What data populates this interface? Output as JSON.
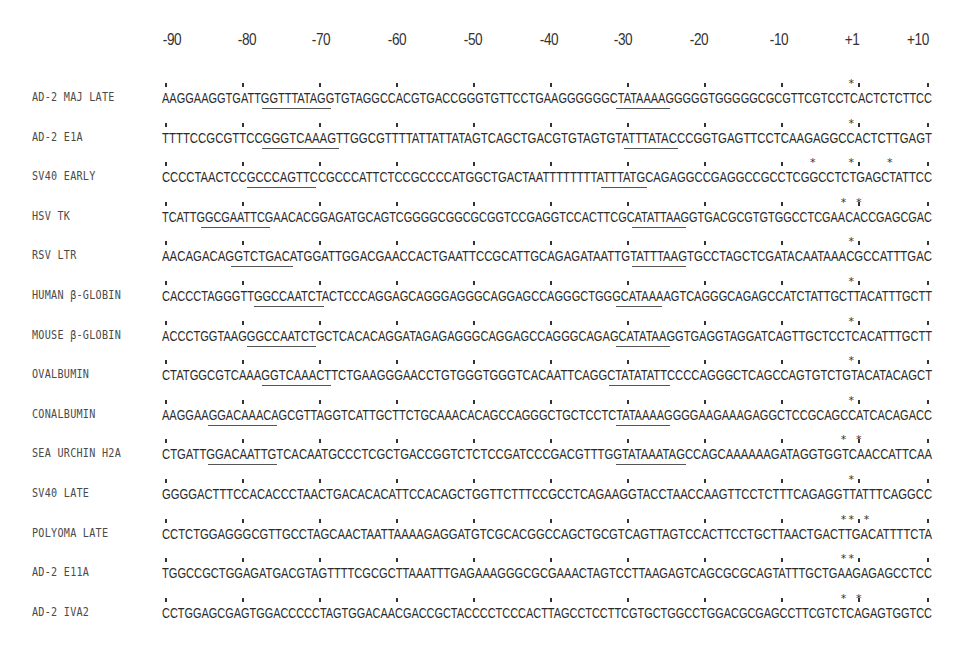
{
  "figure": {
    "axis_ticks": [
      "-90",
      "-80",
      "-70",
      "-60",
      "-50",
      "-40",
      "-30",
      "-20",
      "-10",
      "+1",
      "+10"
    ],
    "axis_tick_x": [
      172,
      247,
      321,
      397,
      473,
      549,
      623,
      699,
      779,
      852,
      918
    ],
    "rows": [
      {
        "label": "AD-2 MAJ LATE",
        "sequence": "AAGGAAGGTGATTGGTTTATAGGTGTAGGCCACGTGACCGGGTGTTCCTGAAGGGGGGCTATAAAAGGGGGTGGGGGCGCGTTCGTCCTCACTCTCTTCC",
        "underline": [
          [
            13,
            22
          ],
          [
            59,
            66
          ]
        ],
        "stars": [
          89
        ]
      },
      {
        "label": "AD-2 E1A",
        "sequence": "TTTTCCGCGTTCCGGGTCAAAGTTGGCGTTTTATTATTATAGTCAGCTGACGTGTAGTGTATTTATACCCGGTGAGTTCCTCAAGAGGCCACTCTTGAGT",
        "underline": [
          [
            13,
            23
          ],
          [
            60,
            67
          ]
        ],
        "stars": [
          89
        ]
      },
      {
        "label": "SV40 EARLY",
        "sequence": "CCCCTAACTCCGCCCAGTTCCGCCCATTCTCCGCCCCATGGCTGACTAATTTTTTTTATTTATGCAGAGGCCGAGGCCGCCTCGGCCTCTGAGCTATTCC",
        "underline": [
          [
            11,
            20
          ],
          [
            57,
            63
          ]
        ],
        "stars": [
          84,
          89,
          94
        ]
      },
      {
        "label": "HSV TK",
        "sequence": "TCATTGGCGAATTCGAACACGGAGATGCAGTCGGGGCGGCGCGGTCCGAGGTCCACTTCGCATATTAAGGTGACGCGTGTGGCCTCGAACACCGAGCGAC",
        "underline": [
          [
            5,
            14
          ],
          [
            61,
            68
          ]
        ],
        "stars": [
          88,
          90
        ]
      },
      {
        "label": "RSV LTR",
        "sequence": "AACAGACAGGTCTGACATGGATTGGACGAACCACTGAATTCCGCATTGCAGAGATAATTGTATTTAAGTGCCTAGCTCGATACAATAAACGCCATTTGAC",
        "underline": [
          [
            9,
            17
          ],
          [
            61,
            68
          ]
        ],
        "stars": [
          89
        ]
      },
      {
        "label": "HUMAN β-GLOBIN",
        "sequence": "CACCCTAGGGTTGGCCAATCTACTCCCAGGAGCAGGGAGGGCAGGAGCCAGGGCTGGGCATAAAAGTCAGGGCAGAGCCATCTATTGCTTACATTTGCTT",
        "underline": [
          [
            12,
            21
          ],
          [
            59,
            65
          ]
        ],
        "stars": [
          89
        ]
      },
      {
        "label": "MOUSE β-GLOBIN",
        "sequence": "ACCCTGGTAAGGGCCAATCTGCTCACACAGGATAGAGAGGGCAGGAGCCAGGGCAGAGCATATAAGGTGAGGTAGGATCAGTTGCTCCTCACATTTGCTT",
        "underline": [
          [
            11,
            20
          ],
          [
            59,
            66
          ]
        ],
        "stars": [
          89
        ]
      },
      {
        "label": "OVALBUMIN",
        "sequence": "CTATGGCGTCAAAGGTCAAACTTCTGAAGGGAACCTGTGGGTGGGTCACAATTCAGGCTATATATTCCCCAGGGCTCAGCCAGTGTCTGTACATACAGCT",
        "underline": [
          [
            13,
            22
          ],
          [
            58,
            66
          ]
        ],
        "stars": [
          89
        ]
      },
      {
        "label": "CONALBUMIN",
        "sequence": "AAGGAAGGACAAACAGCGTTAGGTCATTGCTTCTGCAAACACAGCCAGGGCTGCTCCTCTATAAAAGGGGAAGAAAGAGGCTCCGCAGCCATCACAGACC",
        "underline": [
          [
            6,
            15
          ],
          [
            59,
            66
          ]
        ],
        "stars": [
          89
        ]
      },
      {
        "label": "SEA URCHIN H2A",
        "sequence": "CTGATTGGACAATTGTCACAATGCCCTCGCTGACCGGTCTCTCCGATCCCGACGTTTGGTATAAATAGCCAGCAAAAAAGATAGGTGGTCAACCATTCAA",
        "underline": [
          [
            6,
            15
          ],
          [
            59,
            68
          ]
        ],
        "stars": [
          88,
          90
        ]
      },
      {
        "label": "SV40 LATE",
        "sequence": "GGGGACTTTCCACACCCTAACTGACACACATTCCACAGCTGGTTCTTTCCGCCTCAGAAGGTACCTAACCAAGTTCCTCTTTCAGAGGTTATTTCAGGCC",
        "underline": [],
        "stars": [
          89
        ]
      },
      {
        "label": "POLYOMA LATE",
        "sequence": "CCTCTGGAGGGCGTTGCCTAGCAACTAATTAAAAGAGGATGTCGCACGGCCAGCTGCGTCAGTTAGTCCACTTCCTGCTTAACTGACTTGACATTTTCTA",
        "underline": [],
        "stars": [
          88,
          89,
          91
        ]
      },
      {
        "label": "AD-2 E11A",
        "sequence": "TGGCCGCTGGAGATGACGTAGTTTTCGCGCTTAAATTTGAGAAAGGGCGCGAAACTAGTCCTTAAGAGTCAGCGCGCAGTATTTGCTGAAGAGAGCCTCC",
        "underline": [],
        "stars": [
          88,
          89
        ]
      },
      {
        "label": "AD-2 IVA2",
        "sequence": "CCTGGAGCGAGTGGACCCCCTAGTGGACAACGACCGCTACCCCTCCCACTTAGCCTCCTTCGTGCTGGCCTGGACGCGAGCCTTCGTCTCAGAGTGGTCC",
        "underline": [],
        "stars": [
          88,
          90
        ]
      }
    ]
  }
}
